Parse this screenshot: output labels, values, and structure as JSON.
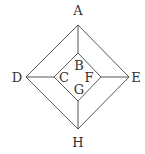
{
  "diagram": {
    "type": "graph",
    "colors": {
      "line": "#444444",
      "text": "#333333",
      "background": "#ffffff"
    },
    "nodes": [
      {
        "id": "A",
        "label": "A",
        "x": 78,
        "y": 25,
        "lx": 78,
        "ly": 15
      },
      {
        "id": "D",
        "label": "D",
        "x": 26,
        "y": 77,
        "lx": 17,
        "ly": 82
      },
      {
        "id": "E",
        "label": "E",
        "x": 129,
        "y": 77,
        "lx": 136,
        "ly": 82
      },
      {
        "id": "H",
        "label": "H",
        "x": 78,
        "y": 129,
        "lx": 78,
        "ly": 147
      },
      {
        "id": "B",
        "label": "B",
        "x": 78,
        "y": 53,
        "lx": 79,
        "ly": 70
      },
      {
        "id": "C",
        "label": "C",
        "x": 54,
        "y": 77,
        "lx": 64,
        "ly": 82
      },
      {
        "id": "F",
        "label": "F",
        "x": 101,
        "y": 77,
        "lx": 89,
        "ly": 82
      },
      {
        "id": "G",
        "label": "G",
        "x": 78,
        "y": 101,
        "lx": 79,
        "ly": 94
      }
    ],
    "edges": [
      [
        "A",
        "E"
      ],
      [
        "E",
        "H"
      ],
      [
        "H",
        "D"
      ],
      [
        "D",
        "A"
      ],
      [
        "B",
        "F"
      ],
      [
        "F",
        "G"
      ],
      [
        "G",
        "C"
      ],
      [
        "C",
        "B"
      ],
      [
        "A",
        "B"
      ],
      [
        "D",
        "C"
      ],
      [
        "E",
        "F"
      ],
      [
        "H",
        "G"
      ]
    ]
  }
}
